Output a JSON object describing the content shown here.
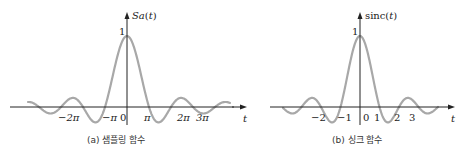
{
  "chart_data": [
    {
      "type": "line",
      "title": "Sa(t)",
      "caption": "(a) 샘플링 함수",
      "xlabel": "t",
      "ylabel": "Sa(t)",
      "function": "sin(t)/t",
      "y_tick": "1",
      "x_ticks": [
        "−2π",
        "−π",
        "0",
        "π",
        "2π",
        "3π"
      ],
      "x_tick_values": [
        -6.283,
        -3.1416,
        0,
        3.1416,
        6.283,
        9.425
      ],
      "x_range": [
        -15.1,
        15.1
      ],
      "peak": 1
    },
    {
      "type": "line",
      "title": "sinc(t)",
      "caption": "(b) 싱크 함수",
      "xlabel": "t",
      "ylabel": "sinc(t)",
      "function": "sin(πt)/(πt)",
      "y_tick": "1",
      "x_ticks": [
        "−2",
        "−1",
        "0",
        "1",
        "2",
        "3"
      ],
      "x_tick_values": [
        -2,
        -1,
        0,
        1,
        2,
        3
      ],
      "x_range": [
        -4.7,
        4.7
      ],
      "peak": 1
    }
  ],
  "left": {
    "ylabel_a": "Sa",
    "ylabel_b": "(t)",
    "one": "1",
    "t": "t",
    "caption": "(a) 샘플링 함수",
    "ticks": {
      "m2pi": "−2π",
      "mpi": "−π",
      "zero": "0",
      "pi": "π",
      "2pi": "2π",
      "3pi": "3π"
    }
  },
  "right": {
    "ylabel_a": "sinc(",
    "ylabel_b": "t",
    "ylabel_c": ")",
    "one": "1",
    "t": "t",
    "caption": "(b) 싱크 함수",
    "ticks": {
      "m2": "−2",
      "m1": "−1",
      "zero": "0",
      "p1": "1",
      "p2": "2",
      "p3": "3"
    }
  },
  "colors": {
    "curve": "#a8a8a8",
    "axis": "#222222"
  }
}
